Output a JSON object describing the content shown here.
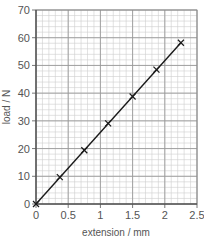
{
  "chart_data": {
    "type": "line",
    "title": "",
    "xlabel": "extension / mm",
    "ylabel": "load / N",
    "xlim": [
      0,
      2.5
    ],
    "ylim": [
      0,
      70
    ],
    "x_ticks": [
      0,
      0.5,
      1,
      1.5,
      2,
      2.5
    ],
    "x_tick_labels": [
      "0",
      "0.5",
      "1",
      "1.5",
      "2",
      "2.5"
    ],
    "y_ticks": [
      0,
      10,
      20,
      30,
      40,
      50,
      60,
      70
    ],
    "y_tick_labels": [
      "0",
      "10",
      "20",
      "30",
      "40",
      "50",
      "60",
      "70"
    ],
    "grid": true,
    "minor_grid_x_step": 0.1,
    "minor_grid_y_step": 2,
    "series": [
      {
        "name": "load vs extension",
        "marker": "x",
        "x": [
          0,
          0.37,
          0.75,
          1.12,
          1.5,
          1.87,
          2.25
        ],
        "y": [
          0,
          9.7,
          19.4,
          29.1,
          38.8,
          48.5,
          58.2
        ]
      }
    ],
    "best_fit_line": {
      "from": [
        0,
        0
      ],
      "to": [
        2.25,
        58.2
      ]
    },
    "colors": {
      "line": "#1a1a1a",
      "grid_major": "#9a9a9a",
      "grid_minor": "#cfcfcf",
      "text": "#555555"
    }
  }
}
